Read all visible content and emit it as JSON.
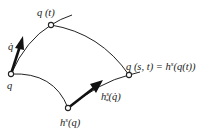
{
  "diagram": {
    "type": "flow-deformation-sketch",
    "labels": {
      "q": "q",
      "q_t": "q (t)",
      "q_dot": "q̇",
      "h_s_q": "h",
      "h_s_q_sup": "s",
      "h_s_q_tail": "(q)",
      "q_st_lhs": "q (s, t) = h",
      "q_st_sup": "s",
      "q_st_tail": "(q(t))",
      "push": "h",
      "push_sup": "s",
      "push_sub": "*",
      "push_tail": "(q̇)"
    },
    "points": {
      "q": [
        11,
        74
      ],
      "q_t": [
        51,
        25
      ],
      "h_s_q": [
        68,
        108
      ],
      "q_s_t": [
        129,
        75
      ]
    },
    "colors": {
      "stroke": "#222222",
      "arrow": "#111111",
      "background": "#ffffff"
    }
  }
}
